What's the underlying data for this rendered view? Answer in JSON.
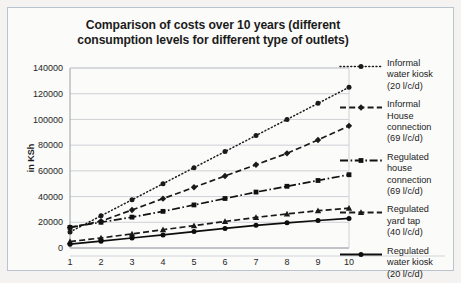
{
  "chart_data": {
    "type": "line",
    "title": "Comparison of costs over 10 years (different consumption levels for different type of outlets)",
    "title_line1": "Comparison of costs over 10 years (different",
    "title_line2": "consumption levels for different type of outlets)",
    "xlabel": "",
    "ylabel": "in KSh",
    "x": [
      1,
      2,
      3,
      4,
      5,
      6,
      7,
      8,
      9,
      10
    ],
    "xtick_labels": [
      "1",
      "2",
      "3",
      "4",
      "5",
      "6",
      "7",
      "8",
      "9",
      "10"
    ],
    "ytick_labels": [
      "0",
      "20000",
      "40000",
      "60000",
      "80000",
      "100000",
      "120000",
      "140000"
    ],
    "ylim": [
      0,
      140000
    ],
    "ytick_step": 20000,
    "grid": true,
    "legend_position": "right",
    "series": [
      {
        "name": "Informal water kiosk (20 l/c/d)",
        "label_line1": "Informal",
        "label_line2": "water kiosk",
        "label_line3": "(20 l/c/d)",
        "style": "dotted",
        "marker": "circle",
        "color": "#1a1a1a",
        "values": [
          12500,
          25000,
          37500,
          50000,
          62500,
          75000,
          87500,
          100000,
          112500,
          125000
        ]
      },
      {
        "name": "Informal House connection (69 l/c/d)",
        "label_line1": "Informal",
        "label_line2": "House",
        "label_line3": "connection",
        "label_line4": "(69 l/c/d)",
        "style": "dashed",
        "marker": "diamond",
        "color": "#1a1a1a",
        "values": [
          16000,
          20800,
          29600,
          38400,
          47200,
          56000,
          64800,
          73600,
          84000,
          95000
        ]
      },
      {
        "name": "Regulated house connection (69 l/c/d)",
        "label_line1": "Regulated",
        "label_line2": "house",
        "label_line3": "connection",
        "label_line4": "(69 l/c/d)",
        "style": "dashdot",
        "marker": "square",
        "color": "#111111",
        "values": [
          16000,
          20000,
          24000,
          28500,
          33500,
          38500,
          43500,
          48000,
          52500,
          57000
        ]
      },
      {
        "name": "Regulated yard tap (40 l/c/d)",
        "label_line1": "Regulated",
        "label_line2": "yard tap",
        "label_line3": "(40 l/c/d)",
        "style": "dashed",
        "marker": "triangle",
        "color": "#1a1a1a",
        "values": [
          5000,
          7800,
          11000,
          14200,
          17400,
          20600,
          23800,
          26500,
          29000,
          31000
        ]
      },
      {
        "name": "Regulated water kiosk (20 l/c/d)",
        "label_line1": "Regulated",
        "label_line2": "water kiosk",
        "label_line3": "(20 l/c/d)",
        "style": "solid",
        "marker": "circle",
        "color": "#0d0d0d",
        "values": [
          3000,
          5300,
          7800,
          10200,
          12800,
          15200,
          17600,
          19600,
          21400,
          23000
        ]
      }
    ]
  },
  "colors": {
    "card_bg": "#fbfbfa",
    "page_bg": "#f4f3f1",
    "border": "#b9c4cf",
    "grid": "#c8ccd0",
    "text": "#1b1b1b"
  }
}
